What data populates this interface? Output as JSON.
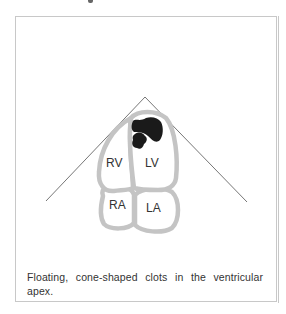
{
  "figure": {
    "labels": {
      "rv": "RV",
      "lv": "LV",
      "ra": "RA",
      "la": "LA"
    },
    "colors": {
      "wall": "#c4c4c4",
      "clot": "#1a1a1a",
      "sector_line": "#555555",
      "frame": "#c8c8c8"
    }
  },
  "caption": "Floating, cone-shaped clots in the ventricular apex."
}
